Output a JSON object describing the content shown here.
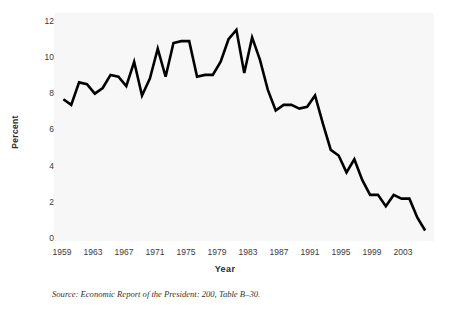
{
  "figure": {
    "source_note": "Source: Economic Report of the President: 200, Table B–30."
  },
  "chart_data": {
    "type": "line",
    "title": "",
    "xlabel": "Year",
    "ylabel": "Percent",
    "xlim": [
      1958,
      2006
    ],
    "ylim": [
      0,
      12
    ],
    "grid": false,
    "legend": "none",
    "line_color": "#000000",
    "line_width": 2.6,
    "background": "#f7f7f7",
    "xtick_labels": [
      "1959",
      "1963",
      "1967",
      "1971",
      "1975",
      "1979",
      "1983",
      "1987",
      "1991",
      "1995",
      "1999",
      "2003"
    ],
    "xtick_values": [
      1959,
      1963,
      1967,
      1971,
      1975,
      1979,
      1983,
      1987,
      1991,
      1995,
      1999,
      2003
    ],
    "ytick_labels": [
      "0",
      "2",
      "4",
      "6",
      "8",
      "10",
      "12"
    ],
    "ytick_values": [
      0,
      2,
      4,
      6,
      8,
      10,
      12
    ],
    "x": [
      1959,
      1960,
      1961,
      1962,
      1963,
      1964,
      1965,
      1966,
      1967,
      1968,
      1969,
      1970,
      1971,
      1972,
      1973,
      1974,
      1975,
      1976,
      1977,
      1978,
      1979,
      1980,
      1981,
      1982,
      1983,
      1984,
      1985,
      1986,
      1987,
      1988,
      1989,
      1990,
      1991,
      1992,
      1993,
      1994,
      1995,
      1996,
      1997,
      1998,
      1999,
      2000,
      2001,
      2002,
      2003,
      2004,
      2005
    ],
    "values": [
      7.4,
      7.1,
      8.3,
      8.2,
      7.7,
      8.0,
      8.7,
      8.6,
      8.1,
      9.4,
      7.6,
      8.5,
      10.1,
      8.6,
      10.4,
      10.5,
      10.5,
      8.6,
      8.7,
      8.7,
      9.4,
      10.6,
      11.1,
      8.8,
      10.7,
      9.5,
      7.9,
      6.8,
      7.1,
      7.1,
      6.9,
      7.0,
      7.6,
      6.1,
      4.7,
      4.4,
      3.5,
      4.2,
      3.1,
      2.3,
      2.3,
      1.7,
      2.3,
      2.1,
      2.1,
      1.1,
      0.4
    ],
    "series": [
      {
        "name": "Percent",
        "values": [
          7.4,
          7.1,
          8.3,
          8.2,
          7.7,
          8.0,
          8.7,
          8.6,
          8.1,
          9.4,
          7.6,
          8.5,
          10.1,
          8.6,
          10.4,
          10.5,
          10.5,
          8.6,
          8.7,
          8.7,
          9.4,
          10.6,
          11.1,
          8.8,
          10.7,
          9.5,
          7.9,
          6.8,
          7.1,
          7.1,
          6.9,
          7.0,
          7.6,
          6.1,
          4.7,
          4.4,
          3.5,
          4.2,
          3.1,
          2.3,
          2.3,
          1.7,
          2.3,
          2.1,
          2.1,
          1.1,
          0.4
        ]
      }
    ],
    "annotations": []
  }
}
